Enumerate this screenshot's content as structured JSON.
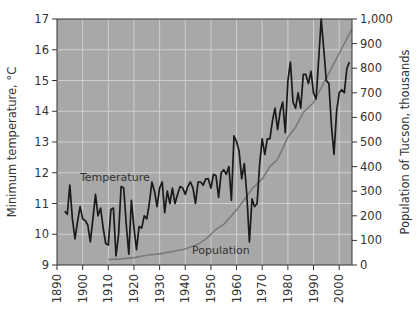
{
  "chart_data": {
    "type": "line",
    "title": "",
    "xlabel": "",
    "ylabel": "Minimum temperature, °C",
    "y2label": "Population of Tucson, thousands",
    "xlim": [
      1890,
      2005
    ],
    "ylim": [
      9,
      17
    ],
    "y2lim": [
      0,
      1000
    ],
    "grid": true,
    "legend": "inline labels",
    "x_ticks": [
      1890,
      1900,
      1910,
      1920,
      1930,
      1940,
      1950,
      1960,
      1970,
      1980,
      1990,
      2000
    ],
    "y_ticks": [
      9,
      10,
      11,
      12,
      13,
      14,
      15,
      16,
      17
    ],
    "y2_ticks": [
      "0",
      "100",
      "200",
      "300",
      "400",
      "500",
      "600",
      "700",
      "800",
      "900",
      "1,000"
    ],
    "annotations": [
      {
        "text": "Temperature",
        "x": 1898,
        "y": 11.6
      },
      {
        "text": "Population",
        "x": 1945,
        "y": 9.3
      }
    ],
    "series": [
      {
        "name": "Temperature",
        "axis": "left",
        "color": "#1a1a1a",
        "x": [
          1893,
          1894,
          1895,
          1896,
          1897,
          1898,
          1899,
          1900,
          1901,
          1902,
          1903,
          1904,
          1905,
          1906,
          1907,
          1908,
          1909,
          1910,
          1911,
          1912,
          1913,
          1914,
          1915,
          1916,
          1917,
          1918,
          1919,
          1920,
          1921,
          1922,
          1923,
          1924,
          1925,
          1926,
          1927,
          1928,
          1929,
          1930,
          1931,
          1932,
          1933,
          1934,
          1935,
          1936,
          1937,
          1938,
          1939,
          1940,
          1941,
          1942,
          1943,
          1944,
          1945,
          1946,
          1947,
          1948,
          1949,
          1950,
          1951,
          1952,
          1953,
          1954,
          1955,
          1956,
          1957,
          1958,
          1959,
          1960,
          1961,
          1962,
          1963,
          1964,
          1965,
          1966,
          1967,
          1968,
          1969,
          1970,
          1971,
          1972,
          1973,
          1974,
          1975,
          1976,
          1977,
          1978,
          1979,
          1980,
          1981,
          1982,
          1983,
          1984,
          1985,
          1986,
          1987,
          1988,
          1989,
          1990,
          1991,
          1992,
          1993,
          1994,
          1995,
          1996,
          1997,
          1998,
          1999,
          2000,
          2001,
          2002,
          2003,
          2004
        ],
        "values": [
          10.75,
          10.65,
          11.6,
          10.5,
          9.85,
          10.4,
          10.9,
          10.5,
          10.45,
          10.3,
          9.75,
          10.5,
          11.3,
          10.6,
          10.85,
          10.2,
          9.7,
          9.65,
          10.8,
          10.85,
          9.3,
          10.0,
          11.55,
          11.5,
          10.3,
          9.35,
          11.1,
          10.2,
          9.5,
          10.25,
          10.2,
          10.6,
          10.5,
          11.0,
          11.7,
          11.4,
          10.9,
          11.5,
          11.7,
          10.7,
          11.4,
          11.0,
          11.5,
          11.0,
          11.3,
          11.55,
          11.5,
          11.3,
          11.55,
          11.7,
          11.5,
          11.0,
          11.7,
          11.7,
          11.6,
          11.8,
          11.8,
          11.5,
          11.95,
          11.9,
          11.2,
          12.0,
          12.1,
          11.95,
          12.2,
          11.1,
          13.2,
          13.0,
          12.7,
          11.8,
          12.3,
          11.3,
          9.75,
          11.15,
          10.9,
          11.0,
          12.3,
          13.1,
          12.6,
          13.1,
          13.1,
          13.7,
          14.1,
          13.4,
          14.0,
          14.3,
          13.3,
          15.0,
          15.6,
          14.3,
          14.1,
          14.6,
          14.1,
          15.2,
          15.2,
          14.9,
          15.3,
          14.6,
          14.4,
          15.7,
          17.0,
          16.0,
          15.0,
          14.9,
          13.5,
          12.6,
          14.0,
          14.6,
          14.7,
          14.6,
          15.4,
          15.6
        ]
      },
      {
        "name": "Population",
        "axis": "right",
        "color": "#777777",
        "x": [
          1910,
          1915,
          1920,
          1925,
          1930,
          1935,
          1940,
          1945,
          1948,
          1950,
          1952,
          1955,
          1958,
          1960,
          1963,
          1966,
          1970,
          1973,
          1976,
          1980,
          1983,
          1986,
          1990,
          1993,
          1996,
          2000,
          2002,
          2005
        ],
        "values": [
          22,
          25,
          30,
          40,
          45,
          55,
          65,
          85,
          105,
          125,
          145,
          165,
          200,
          225,
          265,
          310,
          350,
          400,
          430,
          520,
          560,
          620,
          660,
          720,
          780,
          860,
          900,
          960
        ]
      }
    ]
  },
  "axes": {
    "left_title": "Minimum temperature, °C",
    "right_title": "Population of Tucson, thousands"
  },
  "labels": {
    "temperature": "Temperature",
    "population": "Population"
  },
  "colors": {
    "plot_bg": "#a8a8a8",
    "grid": "#cfcfcf",
    "temperature_line": "#1a1a1a",
    "population_line": "#7a7a7a"
  }
}
